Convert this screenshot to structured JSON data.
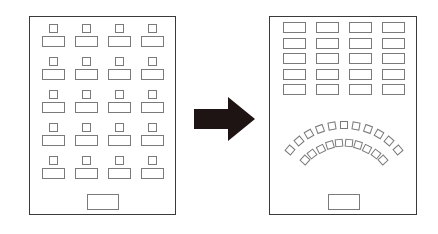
{
  "diagram": {
    "title": "Classroom layout transformation",
    "colors": {
      "room_border": "#3a3a3a",
      "furniture_border": "#7a7a7a",
      "arrow": "#1e1414",
      "background": "#ffffff"
    },
    "before": {
      "label": "Rows of individual desks with chairs",
      "rows": 5,
      "columns": 4,
      "teacher_desk": 1
    },
    "transition": {
      "icon": "right-arrow-icon"
    },
    "after": {
      "label": "Desk block at back with semicircle of chairs facing teacher desk",
      "desk_rows": 5,
      "desk_columns": 4,
      "arc_outer_chairs": 11,
      "arc_inner_chairs": 10,
      "teacher_desk": 1
    }
  }
}
